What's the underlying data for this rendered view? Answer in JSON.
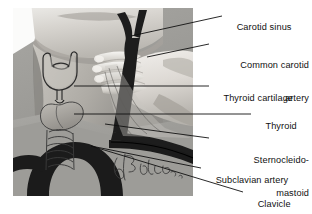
{
  "figure": {
    "kind": "anatomical-photo-illustration",
    "caption_signature": "J. Brado",
    "background_color": "#ffffff",
    "photo": {
      "x": 13,
      "y": 8,
      "width": 180,
      "height": 188,
      "tone": "grayscale",
      "colors": {
        "skin_light": "#d9d6d1",
        "skin_mid": "#b3b0aa",
        "field_gray": "#9b9a96",
        "shadow": "#6f6e6b",
        "vessel_dark": "#1e1e1e",
        "outline": "#2a2a2a"
      },
      "elements": [
        "chin-and-jaw",
        "neck",
        "examiner-hand-fingers",
        "thyroid-cartilage-outline",
        "thyroid-gland",
        "trachea-rings",
        "common-carotid-artery",
        "carotid-sinus-bifurcation",
        "sternocleidomastoid-muscle",
        "subclavian-artery",
        "clavicle",
        "aortic-arch",
        "artist-signature"
      ]
    }
  },
  "labels": [
    {
      "id": "carotid-sinus",
      "line1": "Carotid sinus",
      "line2": "",
      "leader": {
        "x1": 131,
        "y1": 36,
        "x2": 222,
        "y2": 16
      }
    },
    {
      "id": "common-carotid-artery",
      "line1": "Common carotid",
      "line2": "artery",
      "leader": {
        "x1": 147,
        "y1": 57,
        "x2": 209,
        "y2": 44
      }
    },
    {
      "id": "thyroid-cartilage",
      "line1": "Thyroid cartilage",
      "line2": "",
      "leader": {
        "x1": 74,
        "y1": 86,
        "x2": 209,
        "y2": 86
      }
    },
    {
      "id": "thyroid",
      "line1": "Thyroid",
      "line2": "",
      "leader": {
        "x1": 74,
        "y1": 114,
        "x2": 251,
        "y2": 114
      }
    },
    {
      "id": "sternocleidomastoid",
      "line1": "Sternocleido-",
      "line2": "mastoid",
      "leader": {
        "x1": 105,
        "y1": 124,
        "x2": 209,
        "y2": 138
      }
    },
    {
      "id": "subclavian-artery",
      "line1": "Subclavian artery",
      "line2": "",
      "leader": {
        "x1": 91,
        "y1": 146,
        "x2": 201,
        "y2": 168
      }
    },
    {
      "id": "clavicle",
      "line1": "Clavicle",
      "line2": "",
      "leader": {
        "x1": 91,
        "y1": 146,
        "x2": 243,
        "y2": 192
      }
    }
  ],
  "style": {
    "text_color": "#111111",
    "leader_color": "#111111",
    "leader_width": 0.9,
    "font_size_px": 9.2
  }
}
